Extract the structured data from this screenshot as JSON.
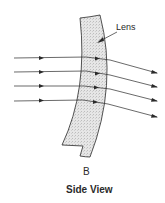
{
  "diagram": {
    "lens_label": "Lens",
    "figure_letter": "B",
    "caption": "Side View",
    "colors": {
      "stroke": "#2a2a2a",
      "lens_fill": "#e2e2e2",
      "background": "#ffffff"
    },
    "rays": [
      {
        "in_y": 58,
        "exit_y": 73
      },
      {
        "in_y": 72,
        "exit_y": 87
      },
      {
        "in_y": 86,
        "exit_y": 101
      },
      {
        "in_y": 101,
        "exit_y": 117
      }
    ]
  }
}
